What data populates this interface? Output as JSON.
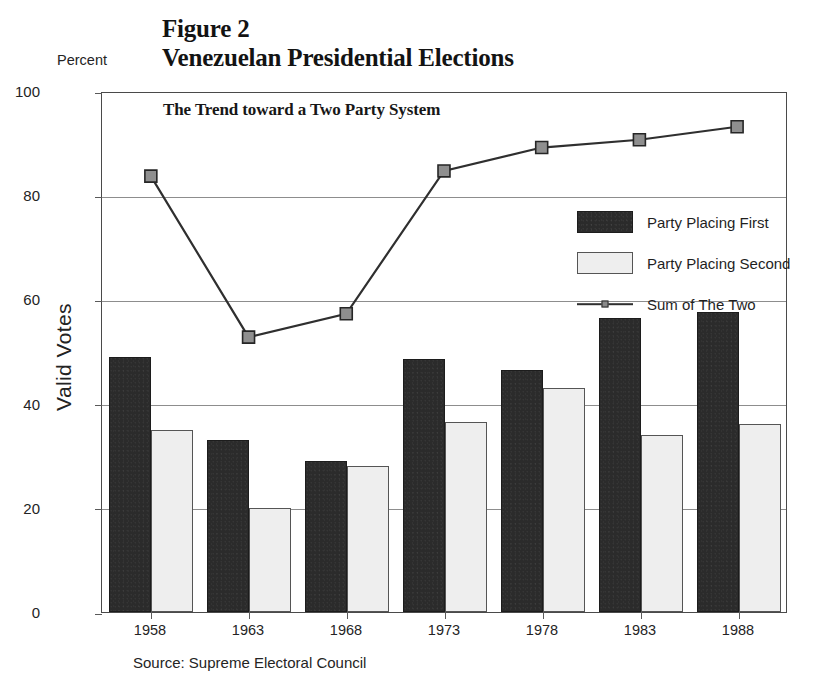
{
  "figure": {
    "number_label": "Figure 2",
    "title": "Venezuelan Presidential Elections",
    "subtitle": "The Trend toward a Two Party System",
    "percent_label": "Percent",
    "source_note": "Source: Supreme Electoral Council"
  },
  "legend": {
    "items": [
      {
        "label": "Party Placing First",
        "marker": "filled-dark-square",
        "color": "#2b2b2b"
      },
      {
        "label": "Party Placing Second",
        "marker": "filled-light-square",
        "color": "#eeeeee"
      },
      {
        "label": "Sum of The Two",
        "marker": "line-with-square-marker",
        "color": "#2f2f2f"
      }
    ]
  },
  "chart_data": {
    "type": "bar",
    "title": "Venezuelan Presidential Elections",
    "subtitle": "The Trend toward a Two Party System",
    "xlabel": "",
    "ylabel": "Valid Votes",
    "unit_label": "Percent",
    "ylim": [
      0,
      100
    ],
    "yticks": [
      0,
      20,
      40,
      60,
      80,
      100
    ],
    "grid": "horizontal",
    "legend_position": "inside-right-upper",
    "categories": [
      "1958",
      "1963",
      "1968",
      "1973",
      "1978",
      "1983",
      "1988"
    ],
    "series": [
      {
        "name": "Party Placing First",
        "type": "bar",
        "color": "#2b2b2b",
        "values": [
          49.0,
          33.0,
          29.0,
          48.5,
          46.5,
          56.5,
          57.5
        ]
      },
      {
        "name": "Party Placing Second",
        "type": "bar",
        "color": "#eeeeee",
        "values": [
          35.0,
          20.0,
          28.0,
          36.5,
          43.0,
          34.0,
          36.0
        ]
      },
      {
        "name": "Sum of The Two",
        "type": "line",
        "color": "#2f2f2f",
        "marker": "square",
        "values": [
          84.0,
          53.0,
          57.5,
          85.0,
          89.5,
          91.0,
          93.5
        ]
      }
    ],
    "source": "Supreme Electoral Council"
  }
}
